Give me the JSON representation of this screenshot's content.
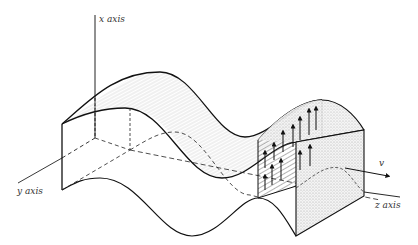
{
  "figure": {
    "labels": {
      "x_axis": "x axis",
      "y_axis": "y axis",
      "z_axis": "z axis",
      "velocity": "v"
    },
    "colors": {
      "line": "#1a1a1a",
      "shade": "#9a9a9a",
      "background": "#ffffff"
    }
  }
}
